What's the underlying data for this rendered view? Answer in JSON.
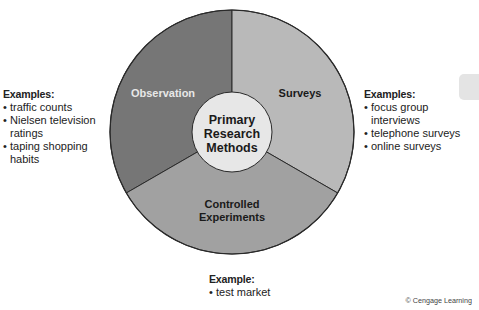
{
  "diagram": {
    "center_label": [
      "Primary",
      "Research",
      "Methods"
    ],
    "segments": [
      {
        "name": "Observation",
        "label": "Observation",
        "color": "#767676",
        "label_color": "#e8e8e8"
      },
      {
        "name": "Surveys",
        "label": "Surveys",
        "color": "#b9b9b9",
        "label_color": "#1a1a1a"
      },
      {
        "name": "Controlled Experiments",
        "label_lines": [
          "Controlled",
          "Experiments"
        ],
        "color": "#a1a1a1",
        "label_color": "#1a1a1a"
      }
    ],
    "center_color": "#e7e7e7",
    "outline_color": "#2a2a2a"
  },
  "examples": {
    "observation": {
      "title": "Examples:",
      "items": [
        "traffic counts",
        "Nielsen television ratings",
        "taping shopping habits"
      ]
    },
    "surveys": {
      "title": "Examples:",
      "items": [
        "focus group interviews",
        "telephone surveys",
        "online surveys"
      ]
    },
    "experiments": {
      "title": "Example:",
      "items": [
        "test market"
      ]
    }
  },
  "credit": "© Cengage Learning"
}
